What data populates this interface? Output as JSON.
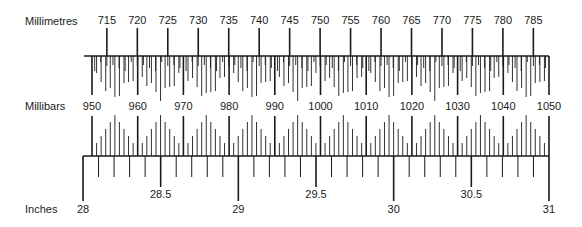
{
  "diagram": {
    "scales": {
      "millimetres": {
        "label": "Millimetres",
        "ticks": [
          "715",
          "720",
          "725",
          "730",
          "735",
          "740",
          "745",
          "750",
          "755",
          "760",
          "765",
          "770",
          "775",
          "780",
          "785"
        ]
      },
      "millibars": {
        "label": "Millibars",
        "ticks": [
          "950",
          "960",
          "970",
          "980",
          "990",
          "1000",
          "1010",
          "1020",
          "1030",
          "1040",
          "1050"
        ]
      },
      "inches": {
        "label": "Inches",
        "major_ticks": [
          "28",
          "29",
          "30",
          "31"
        ],
        "half_ticks": [
          "28.5",
          "29.5",
          "30.5"
        ]
      }
    },
    "colors": {
      "ink": "#1a1a1a",
      "background": "#ffffff"
    }
  }
}
